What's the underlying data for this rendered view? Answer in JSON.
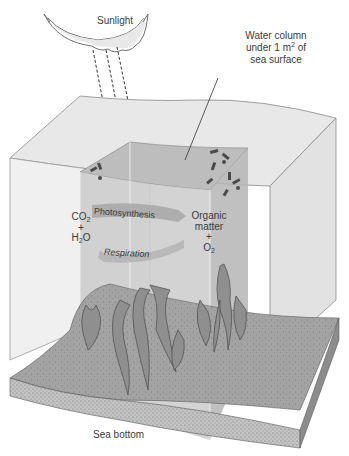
{
  "diagram": {
    "type": "illustration",
    "labels": {
      "sunlight": "Sunlight",
      "water_column_line1": "Water column",
      "water_column_line2_pre": "under 1 m",
      "water_column_sup": "2",
      "water_column_line2_post": " of",
      "water_column_line3": "sea surface",
      "sea_bottom": "Sea bottom"
    },
    "reactants": {
      "co2_main": "CO",
      "co2_sub": "2",
      "plus": "+",
      "h2o_h": "H",
      "h2o_sub": "2",
      "h2o_o": "O"
    },
    "products": {
      "organic_line1": "Organic",
      "organic_line2": "matter",
      "plus": "+",
      "o2_main": "O",
      "o2_sub": "2"
    },
    "processes": {
      "forward": "Photosynthesis",
      "reverse": "Respiration"
    },
    "colors": {
      "water_surface": "#e6e6e6",
      "water_side": "#efefef",
      "column_fill": "#c9c9c9",
      "column_top": "#bdbdbd",
      "seafloor": "#9d9d9d",
      "sediment": "#b9b9b9",
      "seaweed": "#8a8a8a",
      "sun_fill": "#e4e4e4",
      "outline": "#6f6f6f"
    }
  }
}
